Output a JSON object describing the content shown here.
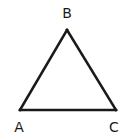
{
  "diagram": {
    "type": "triangle",
    "vertices": [
      {
        "id": "A",
        "label": "A"
      },
      {
        "id": "B",
        "label": "B"
      },
      {
        "id": "C",
        "label": "C"
      }
    ],
    "edges": [
      {
        "from": "A",
        "to": "B"
      },
      {
        "from": "B",
        "to": "C"
      },
      {
        "from": "C",
        "to": "A"
      }
    ],
    "colors": {
      "stroke": "#1a1a1a",
      "background": "#ffffff"
    }
  }
}
